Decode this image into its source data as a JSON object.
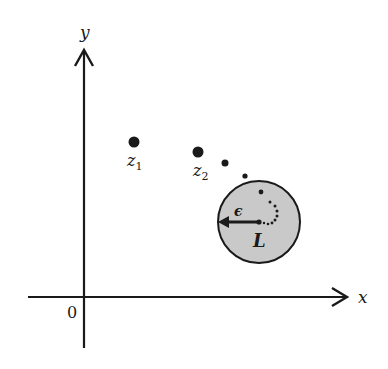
{
  "diagram": {
    "title": "",
    "colors": {
      "ink": "#1a1a1a",
      "disk_fill": "#c9c9c9",
      "background": "#ffffff"
    },
    "axes": {
      "x_label": "x",
      "y_label": "y",
      "origin_label": "0"
    },
    "points": [
      {
        "label": "z",
        "subscript": "1"
      },
      {
        "label": "z",
        "subscript": "2"
      }
    ],
    "disk": {
      "center_label": "L",
      "radius_label": "ϵ"
    }
  }
}
